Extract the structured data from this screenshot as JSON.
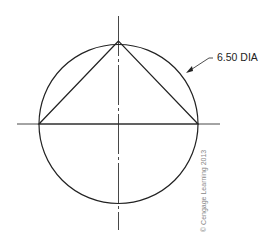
{
  "diagram": {
    "type": "technical-drawing",
    "dimension_label": "6.50 DIA",
    "copyright": "© Cengage Learning 2013",
    "colors": {
      "line": "#222222",
      "centerline": "#333333",
      "copyright": "#888888"
    }
  }
}
